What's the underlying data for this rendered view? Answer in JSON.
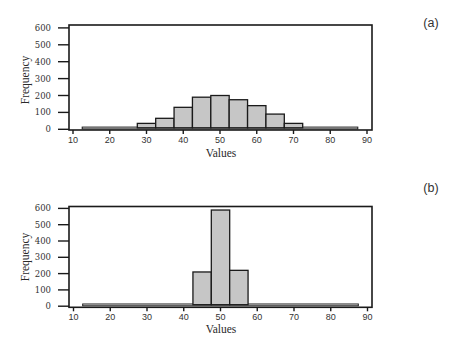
{
  "chart_data": [
    {
      "type": "bar",
      "panel_label": "(a)",
      "title": "",
      "xlabel": "Values",
      "ylabel": "Frequency",
      "bin_width": 5,
      "categories": [
        15,
        20,
        25,
        30,
        35,
        40,
        45,
        50,
        55,
        60,
        65,
        70,
        75,
        80,
        85
      ],
      "values": [
        0,
        0,
        0,
        35,
        65,
        130,
        190,
        200,
        175,
        140,
        90,
        35,
        0,
        0,
        0
      ],
      "x_ticks": [
        10,
        20,
        30,
        40,
        50,
        60,
        70,
        80,
        90
      ],
      "y_ticks": [
        0,
        100,
        200,
        300,
        400,
        500,
        600
      ],
      "xlim": [
        10,
        90
      ],
      "ylim": [
        0,
        600
      ],
      "grid": false,
      "legend": "none"
    },
    {
      "type": "bar",
      "panel_label": "(b)",
      "title": "",
      "xlabel": "Values",
      "ylabel": "Frequency",
      "bin_width": 5,
      "categories": [
        15,
        20,
        25,
        30,
        35,
        40,
        45,
        50,
        55,
        60,
        65,
        70,
        75,
        80,
        85
      ],
      "values": [
        0,
        0,
        0,
        0,
        0,
        0,
        210,
        590,
        220,
        0,
        0,
        0,
        0,
        0,
        0
      ],
      "x_ticks": [
        10,
        20,
        30,
        40,
        50,
        60,
        70,
        80,
        90
      ],
      "y_ticks": [
        0,
        100,
        200,
        300,
        400,
        500,
        600
      ],
      "xlim": [
        10,
        90
      ],
      "ylim": [
        0,
        600
      ],
      "grid": false,
      "legend": "none"
    }
  ],
  "colors": {
    "bar_fill": "#c6c6c6",
    "bar_stroke": "#1a1a1a",
    "axis": "#1a1a1a"
  }
}
